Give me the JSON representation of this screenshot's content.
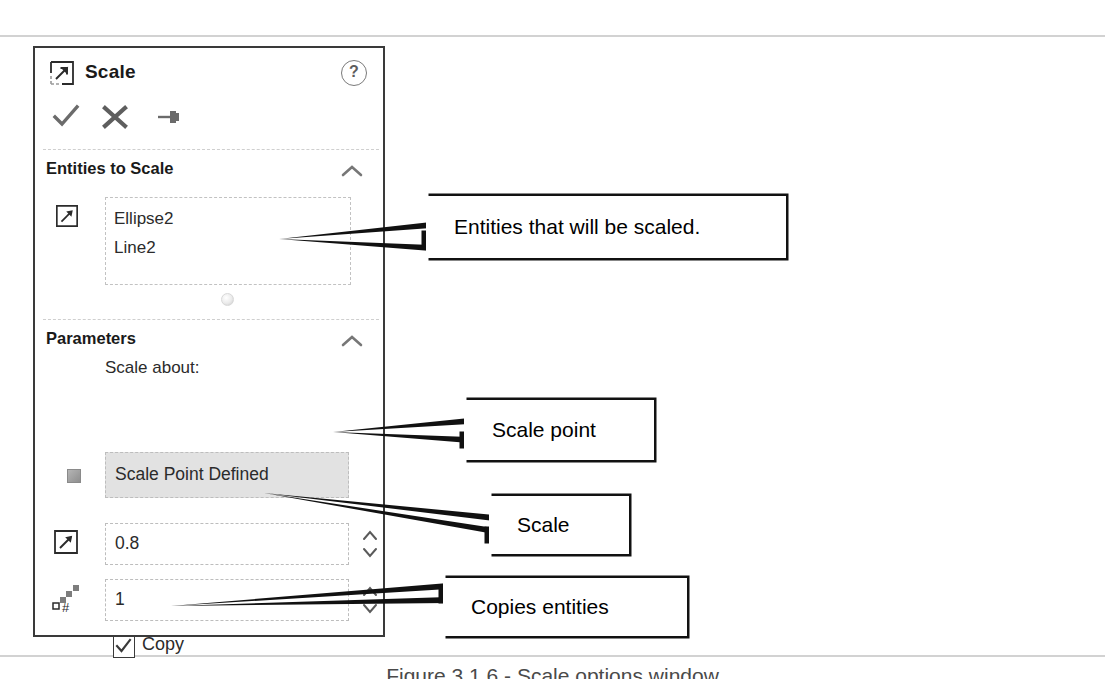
{
  "panel": {
    "title": "Scale",
    "title_icon": "scale-icon",
    "help_label": "?",
    "toolbar": [
      {
        "name": "ok-icon",
        "label": "OK"
      },
      {
        "name": "cancel-icon",
        "label": "Cancel"
      },
      {
        "name": "pin-icon",
        "label": "Keep Visible"
      }
    ],
    "sections": [
      {
        "name": "entities-to-scale",
        "header": "Entities to Scale",
        "collapse_icon": "chevron-up-icon",
        "select_icon": "scale-entities-icon",
        "items": [
          "Ellipse2",
          "Line2"
        ]
      },
      {
        "name": "parameters",
        "header": "Parameters",
        "collapse_icon": "chevron-up-icon",
        "scale_about_label": "Scale about:",
        "scale_about_value": "Scale Point Defined",
        "scale_about_icon": "point-icon",
        "scale_factor_value": "0.8",
        "scale_factor_icon": "scale-factor-icon",
        "copies_value": "1",
        "copies_icon": "number-of-copies-icon",
        "copy_checkbox_label": "Copy",
        "copy_checkbox_checked": true,
        "spinner_up_icon": "chevron-up-icon",
        "spinner_down_icon": "chevron-down-icon"
      }
    ]
  },
  "callouts": [
    {
      "name": "callout-entities",
      "text": "Entities that will be scaled."
    },
    {
      "name": "callout-scalepoint",
      "text": "Scale point"
    },
    {
      "name": "callout-scale",
      "text": "Scale"
    },
    {
      "name": "callout-copy",
      "text": "Copies entities"
    }
  ],
  "caption": "Figure 3.1.6 - Scale options window",
  "colors": {
    "panel_border": "#3a3a3a",
    "callout_border": "#111111",
    "field_dashed": "#bdbdbd",
    "combo_fill": "#e2e2e2",
    "rule": "#d2d2d2"
  }
}
